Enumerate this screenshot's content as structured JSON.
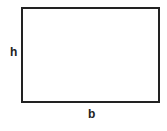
{
  "diagram": {
    "shape": "rectangle",
    "labels": {
      "height": "h",
      "base": "b"
    },
    "colors": {
      "stroke": "#222222",
      "fill": "#ffffff",
      "background": "#ffffff"
    }
  }
}
